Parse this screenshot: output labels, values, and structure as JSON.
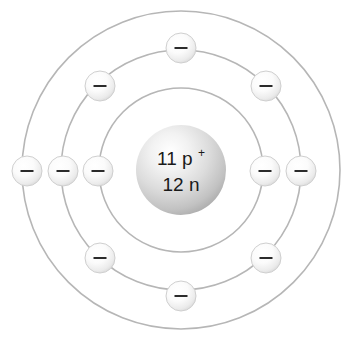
{
  "figure": {
    "element_name": "Sodium",
    "background_color": "#ffffff"
  },
  "nucleus": {
    "name": "nucleus",
    "protons_label": "11 p",
    "protons_charge": "+",
    "neutrons_label": "12 n",
    "protons_count": 11,
    "neutrons_count": 12,
    "center_x": 181,
    "center_y": 170,
    "radius": 45,
    "fill_light": "#ffffff",
    "fill_mid": "#d9d9d9",
    "fill_edge": "#a8a8a8",
    "text_color": "#1a1a1a"
  },
  "shells": [
    {
      "name": "shell-1",
      "label": "K",
      "radius": 82,
      "electron_count": 2,
      "stroke_color": "#b6b6b6"
    },
    {
      "name": "shell-2",
      "label": "L",
      "radius": 120,
      "electron_count": 8,
      "stroke_color": "#b6b6b6"
    },
    {
      "name": "shell-3",
      "label": "M",
      "radius": 159,
      "electron_count": 1,
      "stroke_color": "#b6b6b6"
    }
  ],
  "electrons": [
    {
      "name": "electron-shell1-left",
      "shell": 1,
      "x": 98,
      "y": 171,
      "symbol": "–"
    },
    {
      "name": "electron-shell1-right",
      "shell": 1,
      "x": 265,
      "y": 171,
      "symbol": "–"
    },
    {
      "name": "electron-shell2-top",
      "shell": 2,
      "x": 181,
      "y": 48,
      "symbol": "–"
    },
    {
      "name": "electron-shell2-upper-right",
      "shell": 2,
      "x": 266,
      "y": 86,
      "symbol": "–"
    },
    {
      "name": "electron-shell2-right",
      "shell": 2,
      "x": 301,
      "y": 171,
      "symbol": "–"
    },
    {
      "name": "electron-shell2-lower-right",
      "shell": 2,
      "x": 266,
      "y": 258,
      "symbol": "–"
    },
    {
      "name": "electron-shell2-bottom",
      "shell": 2,
      "x": 181,
      "y": 296,
      "symbol": "–"
    },
    {
      "name": "electron-shell2-lower-left",
      "shell": 2,
      "x": 100,
      "y": 258,
      "symbol": "–"
    },
    {
      "name": "electron-shell2-left",
      "shell": 2,
      "x": 63,
      "y": 171,
      "symbol": "–"
    },
    {
      "name": "electron-shell2-upper-left",
      "shell": 2,
      "x": 100,
      "y": 86,
      "symbol": "–"
    },
    {
      "name": "electron-shell3-left",
      "shell": 3,
      "x": 27,
      "y": 171,
      "symbol": "–"
    }
  ],
  "electron_style": {
    "radius": 15,
    "fill_light": "#ffffff",
    "fill_edge": "#cccccc",
    "stroke_color": "#cfcfcf",
    "minus_color": "#2b2b2b",
    "minus_width": 13,
    "minus_height": 2
  }
}
